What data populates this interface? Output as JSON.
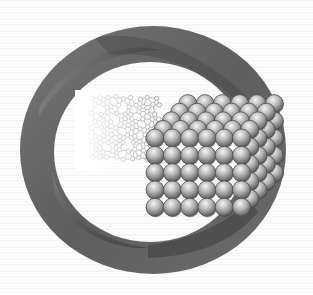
{
  "image": {
    "title": "Nanomaterial structure illustration",
    "description": "Twisted ring band encircling a molecular lattice network transitioning into a close-packed cubic stack of spheres",
    "width": 313,
    "height": 295
  },
  "colors": {
    "background": "#ffffff",
    "background_lines": "#ececec",
    "ring_dark": "#3e3e3e",
    "ring_mid": "#6a6a6a",
    "ring_light": "#9a9a9a",
    "sphere_highlight": "#f4f4f4",
    "sphere_mid": "#a8a8a8",
    "sphere_shadow": "#4a4a4a",
    "lattice_stroke": "#9c9c9c"
  },
  "elements": {
    "ring": {
      "label": "twisted-ring-band",
      "cx": 153,
      "cy": 150,
      "outer_rx": 133,
      "outer_ry": 124,
      "band_width": 36
    },
    "lattice": {
      "label": "molecular-lattice-network",
      "fade_direction": "left"
    },
    "sphere_stack": {
      "label": "close-packed-sphere-cube",
      "sphere_radius": 9,
      "spacing": 17.3,
      "front_columns": 6,
      "front_rows": 5,
      "depth_layers": 5
    }
  }
}
